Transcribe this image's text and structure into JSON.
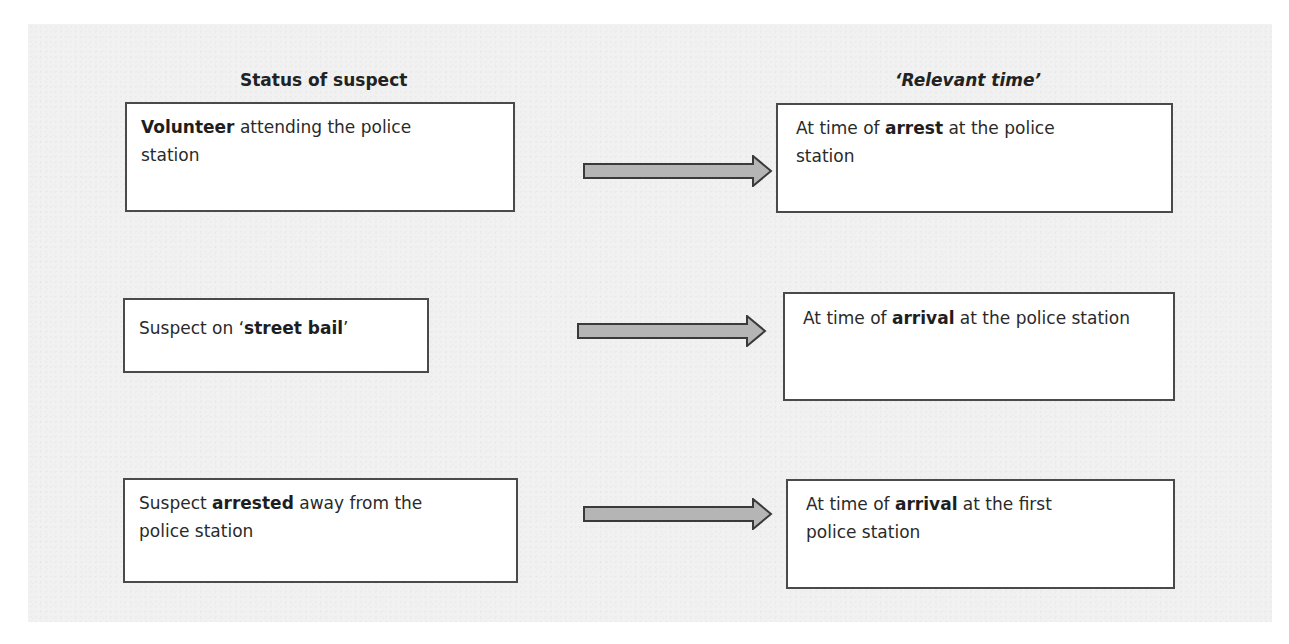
{
  "diagram": {
    "headings": {
      "left": "Status of suspect",
      "right": "‘Relevant time’"
    },
    "rows": [
      {
        "status": {
          "before": "",
          "bold": "Volunteer",
          "after": " attending the police station"
        },
        "relevant_time": {
          "before": "At time of ",
          "bold": "arrest",
          "after": " at the police station"
        }
      },
      {
        "status": {
          "before": "Suspect on ‘",
          "bold": "street bail",
          "after": "’"
        },
        "relevant_time": {
          "before": "At time of ",
          "bold": "arrival",
          "after": " at the police station"
        }
      },
      {
        "status": {
          "before": "Suspect ",
          "bold": "arrested",
          "after": " away from the police station"
        },
        "relevant_time": {
          "before": "At time of ",
          "bold": "arrival",
          "after": " at the first police station"
        }
      }
    ],
    "colors": {
      "panel_background": "#f1f1f1",
      "box_border": "#4a4a4a",
      "arrow_fill": "#b5b5b5",
      "arrow_stroke": "#3a3a3a"
    }
  }
}
